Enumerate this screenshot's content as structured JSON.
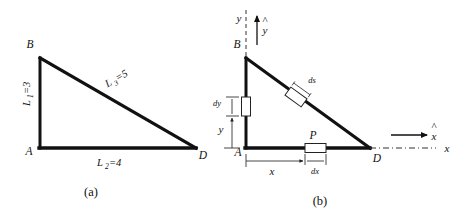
{
  "figure": {
    "panels": [
      {
        "id": "a",
        "caption": "(a)",
        "vertices": [
          {
            "name": "B",
            "label": "B"
          },
          {
            "name": "A",
            "label": "A"
          },
          {
            "name": "D",
            "label": "D"
          }
        ],
        "sides": [
          {
            "name": "vertical-side",
            "symbol": "L",
            "subscript": "1",
            "equals": "=3",
            "full": "L1=3"
          },
          {
            "name": "base-side",
            "symbol": "L",
            "subscript": "2",
            "equals": "=4",
            "full": "L2=4"
          },
          {
            "name": "hypotenuse-side",
            "symbol": "L",
            "subscript": "3",
            "equals": "=5",
            "full": "L3=5"
          }
        ]
      },
      {
        "id": "b",
        "caption": "(b)",
        "vertices": [
          {
            "name": "B",
            "label": "B"
          },
          {
            "name": "A",
            "label": "A"
          },
          {
            "name": "D",
            "label": "D"
          },
          {
            "name": "P",
            "label": "P"
          }
        ],
        "axes": [
          {
            "name": "y-axis",
            "label": "y",
            "unit_vector": "y",
            "hat": "^"
          },
          {
            "name": "x-axis",
            "label": "x",
            "unit_vector": "x",
            "hat": "^"
          }
        ],
        "elements": [
          {
            "name": "ds-element",
            "label": "ds",
            "on": "hypotenuse"
          },
          {
            "name": "dx-element",
            "label": "dx",
            "on": "base"
          },
          {
            "name": "dy-element",
            "label": "dy",
            "on": "vertical-side"
          }
        ],
        "dimensions": [
          {
            "name": "x-dimension",
            "label": "x"
          },
          {
            "name": "y-dimension",
            "label": "y"
          }
        ]
      }
    ]
  },
  "colors": {
    "ink": "#111111",
    "line": "#1a1a1a",
    "thin": "#444444",
    "background": "#ffffff"
  }
}
